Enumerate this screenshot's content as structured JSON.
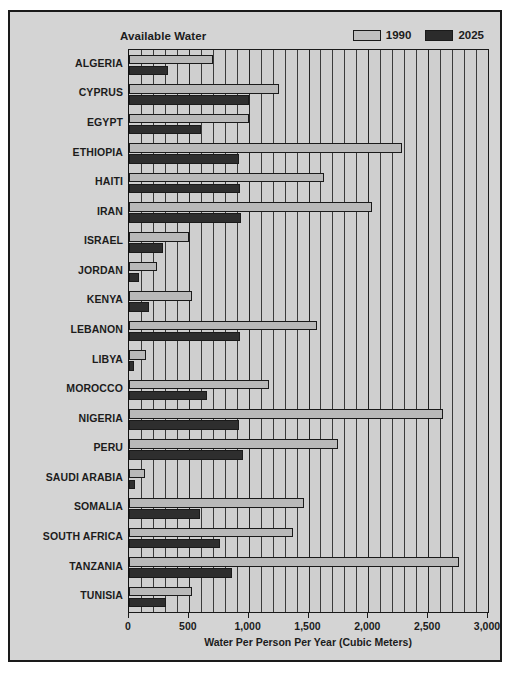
{
  "chart_data": {
    "type": "bar",
    "orientation": "horizontal",
    "title": "Available Water",
    "xlabel": "Water Per Person Per Year (Cubic Meters)",
    "ylabel": "",
    "xlim": [
      0,
      3000
    ],
    "xticks": [
      0,
      500,
      1000,
      1500,
      2000,
      2500,
      3000
    ],
    "xticklabels": [
      "0",
      "500",
      "1,000",
      "1,500",
      "2,000",
      "2,500",
      "3,000"
    ],
    "grid": "vertical-minor-every-100",
    "legend_position": "top-right",
    "categories": [
      "ALGERIA",
      "CYPRUS",
      "EGYPT",
      "ETHIOPIA",
      "HAITI",
      "IRAN",
      "ISRAEL",
      "JORDAN",
      "KENYA",
      "LEBANON",
      "LIBYA",
      "MOROCCO",
      "NIGERIA",
      "PERU",
      "SAUDI ARABIA",
      "SOMALIA",
      "SOUTH AFRICA",
      "TANZANIA",
      "TUNISIA"
    ],
    "series": [
      {
        "name": "1990",
        "color": "#b9b9b9",
        "values": [
          700,
          1250,
          1000,
          2280,
          1630,
          2030,
          500,
          230,
          530,
          1570,
          140,
          1170,
          2620,
          1750,
          130,
          1460,
          1370,
          2760,
          530
        ]
      },
      {
        "name": "2025",
        "color": "#2e2e2e",
        "values": [
          330,
          1000,
          600,
          920,
          930,
          940,
          280,
          80,
          170,
          930,
          40,
          650,
          920,
          950,
          50,
          590,
          760,
          860,
          310
        ]
      }
    ]
  },
  "legend": {
    "entries": [
      {
        "label": "1990",
        "swatch": "light-gray-swatch"
      },
      {
        "label": "2025",
        "swatch": "dark-gray-swatch"
      }
    ]
  },
  "colors": {
    "frame": "#1a1a1a",
    "background": "#d4d4d4",
    "plot_background": "#cfcfcf",
    "series_1990": "#b9b9b9",
    "series_2025": "#2e2e2e"
  }
}
